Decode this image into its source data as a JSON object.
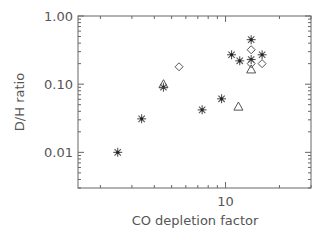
{
  "chart_data": {
    "type": "scatter",
    "title": "",
    "xlabel": "CO depletion factor",
    "ylabel": "D/H ratio",
    "xscale": "log",
    "yscale": "log",
    "xlim": [
      1.5,
      30
    ],
    "ylim": [
      0.003,
      1.0
    ],
    "x_tick_labels": [
      {
        "value": 10,
        "label": "10"
      }
    ],
    "y_tick_labels": [
      {
        "value": 1.0,
        "label": "1.00"
      },
      {
        "value": 0.1,
        "label": "0.10"
      },
      {
        "value": 0.01,
        "label": "0.01"
      }
    ],
    "grid": false,
    "legend": null,
    "series": [
      {
        "name": "asterisk",
        "marker": "asterisk",
        "points": [
          {
            "x": 2.5,
            "y": 0.01
          },
          {
            "x": 3.4,
            "y": 0.031
          },
          {
            "x": 4.5,
            "y": 0.09
          },
          {
            "x": 7.4,
            "y": 0.042
          },
          {
            "x": 9.5,
            "y": 0.061
          },
          {
            "x": 10.8,
            "y": 0.27
          },
          {
            "x": 12.0,
            "y": 0.22
          },
          {
            "x": 13.9,
            "y": 0.45
          },
          {
            "x": 13.9,
            "y": 0.23
          },
          {
            "x": 16.0,
            "y": 0.27
          }
        ]
      },
      {
        "name": "diamond",
        "marker": "diamond",
        "points": [
          {
            "x": 5.5,
            "y": 0.18
          },
          {
            "x": 13.9,
            "y": 0.32
          },
          {
            "x": 13.9,
            "y": 0.2
          },
          {
            "x": 16.0,
            "y": 0.2
          }
        ]
      },
      {
        "name": "triangle",
        "marker": "triangle",
        "points": [
          {
            "x": 4.5,
            "y": 0.1
          },
          {
            "x": 11.8,
            "y": 0.047
          },
          {
            "x": 13.9,
            "y": 0.165
          }
        ]
      }
    ]
  },
  "colors": {
    "axis": "#666666",
    "text": "#555555",
    "marker": "#555555"
  }
}
